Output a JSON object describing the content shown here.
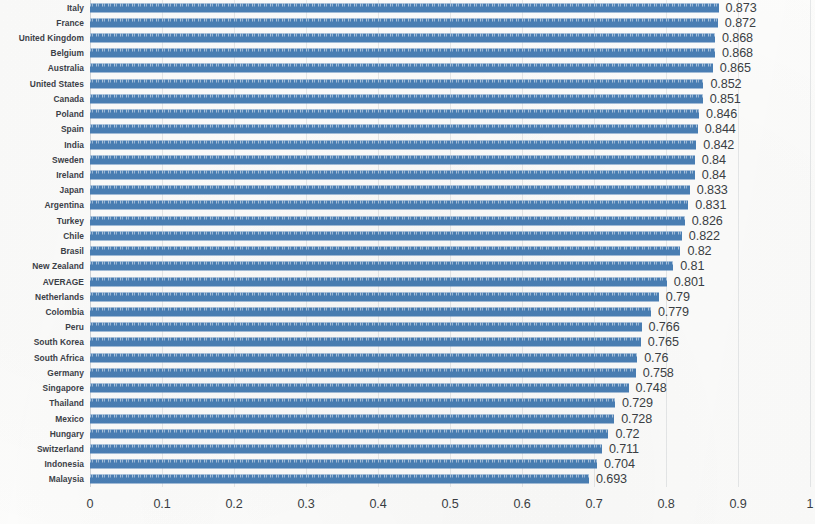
{
  "chart_data": {
    "type": "bar",
    "orientation": "horizontal",
    "title": "",
    "subtitle": "",
    "xlabel": "",
    "ylabel": "",
    "xlim": [
      0,
      1
    ],
    "ylim": null,
    "grid": true,
    "grid_axis": "x",
    "legend": false,
    "legend_position": "none",
    "bar_color": "#4a7fb5",
    "text_color": "#3b3f44",
    "value_label_format": "trimmed-decimal",
    "xticks": [
      "0",
      "0.1",
      "0.2",
      "0.3",
      "0.4",
      "0.5",
      "0.6",
      "0.7",
      "0.8",
      "0.9",
      "1"
    ],
    "xtick_values": [
      0,
      0.1,
      0.2,
      0.3,
      0.4,
      0.5,
      0.6,
      0.7,
      0.8,
      0.9,
      1
    ],
    "categories": [
      "Italy",
      "France",
      "United Kingdom",
      "Belgium",
      "Australia",
      "United States",
      "Canada",
      "Poland",
      "Spain",
      "India",
      "Sweden",
      "Ireland",
      "Japan",
      "Argentina",
      "Turkey",
      "Chile",
      "Brasil",
      "New Zealand",
      "AVERAGE",
      "Netherlands",
      "Colombia",
      "Peru",
      "South Korea",
      "South Africa",
      "Germany",
      "Singapore",
      "Thailand",
      "Mexico",
      "Hungary",
      "Switzerland",
      "Indonesia",
      "Malaysia"
    ],
    "values": [
      0.873,
      0.872,
      0.868,
      0.868,
      0.865,
      0.852,
      0.851,
      0.846,
      0.844,
      0.842,
      0.84,
      0.84,
      0.833,
      0.831,
      0.826,
      0.822,
      0.82,
      0.81,
      0.801,
      0.79,
      0.779,
      0.766,
      0.765,
      0.76,
      0.758,
      0.748,
      0.729,
      0.728,
      0.72,
      0.711,
      0.704,
      0.693
    ],
    "value_labels": [
      "0.873",
      "0.872",
      "0.868",
      "0.868",
      "0.865",
      "0.852",
      "0.851",
      "0.846",
      "0.844",
      "0.842",
      "0.84",
      "0.84",
      "0.833",
      "0.831",
      "0.826",
      "0.822",
      "0.82",
      "0.81",
      "0.801",
      "0.79",
      "0.779",
      "0.766",
      "0.765",
      "0.76",
      "0.758",
      "0.748",
      "0.729",
      "0.728",
      "0.72",
      "0.711",
      "0.704",
      "0.693"
    ]
  }
}
